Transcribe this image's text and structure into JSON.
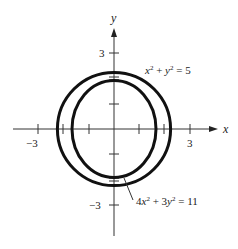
{
  "figure": {
    "axes": {
      "x_label": "x",
      "y_label": "y",
      "x_tick_label_neg": "−3",
      "x_tick_label_pos": "3",
      "y_tick_label_pos": "3",
      "y_tick_label_neg": "−3",
      "x_ticks": [
        -3,
        -2,
        -1,
        1,
        2,
        3
      ],
      "y_ticks": [
        -3,
        -2,
        -1,
        1,
        2,
        3
      ]
    },
    "curves": [
      {
        "name": "circle",
        "equation": "x² + y² = 5",
        "radius": 2.236
      },
      {
        "name": "ellipse",
        "equation": "4x² + 3y² = 11",
        "semi_x": 1.658,
        "semi_y": 1.915
      }
    ],
    "labels": {
      "circle_eq_a": "x",
      "circle_eq_b": "2",
      "circle_eq_c": " + ",
      "circle_eq_d": "y",
      "circle_eq_e": "2",
      "circle_eq_f": " = 5",
      "ellipse_eq_a": "4",
      "ellipse_eq_b": "x",
      "ellipse_eq_c": "2",
      "ellipse_eq_d": " + 3",
      "ellipse_eq_e": "y",
      "ellipse_eq_f": "2",
      "ellipse_eq_g": " = 11"
    },
    "colors": {
      "stroke": "#111111",
      "background": "#ffffff"
    }
  }
}
